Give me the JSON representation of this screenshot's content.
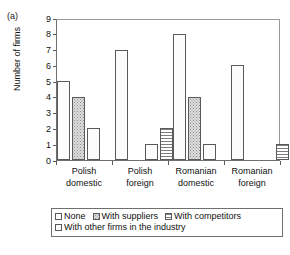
{
  "panel": {
    "label": "(a)"
  },
  "chart_data": {
    "type": "bar",
    "title": "",
    "subtitle": "",
    "xlabel": "",
    "ylabel": "Number of firms",
    "ylim": [
      0,
      9
    ],
    "yticks": [
      0,
      1,
      2,
      3,
      4,
      5,
      6,
      7,
      8,
      9
    ],
    "grid": false,
    "legend_position": "bottom",
    "categories": [
      "Polish domestic",
      "Polish foreign",
      "Romanian domestic",
      "Romanian foreign"
    ],
    "category_lines": [
      [
        "Polish",
        "domestic"
      ],
      [
        "Polish",
        "foreign"
      ],
      [
        "Romanian",
        "domestic"
      ],
      [
        "Romanian",
        "foreign"
      ]
    ],
    "series": [
      {
        "name": "None",
        "pattern": "dots",
        "values": [
          5,
          7,
          8,
          6
        ]
      },
      {
        "name": "With suppliers",
        "pattern": "grey",
        "values": [
          4,
          0,
          4,
          0
        ]
      },
      {
        "name": "With competitors",
        "pattern": "dots",
        "values": [
          2,
          1,
          1,
          0
        ]
      },
      {
        "name": "With other firms in the industry",
        "pattern": "hlines",
        "values": [
          0,
          2,
          0,
          1
        ]
      }
    ]
  },
  "legend": {
    "row1": [
      {
        "label": "None",
        "pattern": "dots"
      },
      {
        "label": "With suppliers",
        "pattern": "grey"
      },
      {
        "label": "With competitors",
        "pattern": "hlines"
      }
    ],
    "row2": [
      {
        "label": "With other firms in the industry",
        "pattern": "dots"
      }
    ]
  },
  "colors": {
    "axis": "#5a5a5a",
    "frame": "#6f6f6f",
    "bar_outline": "#5a5a5a",
    "text": "#111111",
    "background": "#ffffff"
  }
}
